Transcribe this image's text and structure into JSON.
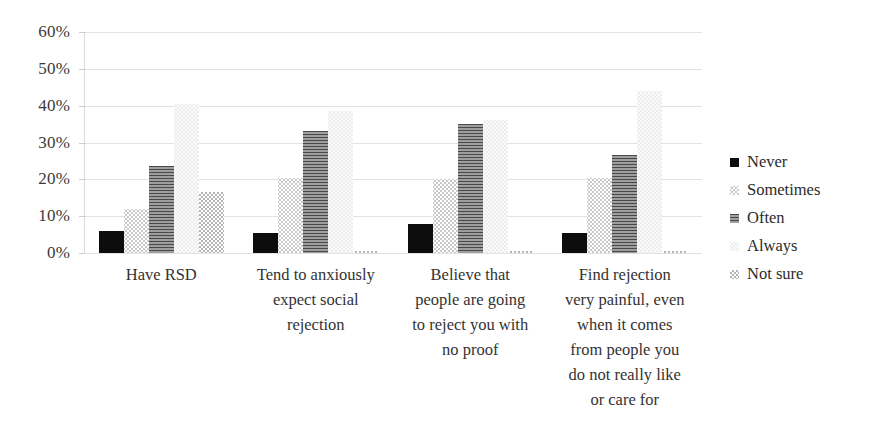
{
  "chart_data": {
    "type": "bar",
    "title": "",
    "xlabel": "",
    "ylabel": "",
    "ylim": [
      0,
      60
    ],
    "ytick_labels": [
      "60%",
      "50%",
      "40%",
      "30%",
      "20%",
      "10%",
      "0%"
    ],
    "ytick_values": [
      60,
      50,
      40,
      30,
      20,
      10,
      0
    ],
    "grid": true,
    "legend_position": "right",
    "categories": [
      "Have RSD",
      "Tend to anxiously expect social rejection",
      "Believe that people are going to reject you with no proof",
      "Find rejection very painful, even when it comes from people you do not really like or care for"
    ],
    "category_lines": [
      [
        "Have RSD"
      ],
      [
        "Tend to anxiously",
        "expect social",
        "rejection"
      ],
      [
        "Believe that",
        "people are going",
        "to reject you with",
        "no proof"
      ],
      [
        "Find rejection",
        "very painful, even",
        "when it comes",
        "from people you",
        "do not really like",
        "or care for"
      ]
    ],
    "series": [
      {
        "name": "Never",
        "pattern": "solid-black",
        "values": [
          6.0,
          5.5,
          8.0,
          5.5
        ]
      },
      {
        "name": "Sometimes",
        "pattern": "light-dotted",
        "values": [
          12.0,
          20.5,
          20.0,
          20.5
        ]
      },
      {
        "name": "Often",
        "pattern": "dark-horizontal",
        "values": [
          23.5,
          33.0,
          35.0,
          26.5
        ]
      },
      {
        "name": "Always",
        "pattern": "very-light-dotted",
        "values": [
          40.5,
          38.5,
          36.0,
          44.0
        ]
      },
      {
        "name": "Not sure",
        "pattern": "grey-checker",
        "values": [
          16.5,
          0.5,
          0.5,
          0.5
        ]
      }
    ]
  },
  "legend": {
    "items": [
      {
        "label": "Never"
      },
      {
        "label": "Sometimes"
      },
      {
        "label": "Often"
      },
      {
        "label": "Always"
      },
      {
        "label": "Not sure"
      }
    ]
  },
  "colors": {
    "never": "#0d0d0d",
    "sometimes": "#c9c9c9",
    "often": "#4a4a4a",
    "always": "#ededed",
    "notsure": "#b4b4b4",
    "grid": "#e2e2e2",
    "text": "#2b2b2b",
    "background": "#ffffff"
  }
}
